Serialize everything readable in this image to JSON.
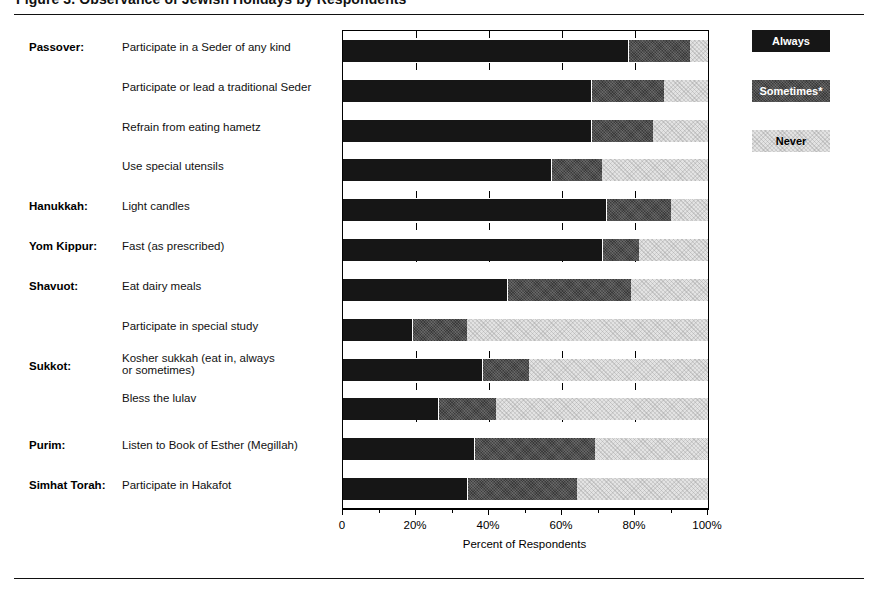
{
  "figure": {
    "title": "Figure 3.  Observance of Jewish Holidays by Respondents",
    "axis_title": "Percent of Respondents"
  },
  "legend": {
    "position": "right",
    "items": [
      {
        "label": "Always",
        "color": "#161616",
        "text_color": "#ffffff"
      },
      {
        "label": "Sometimes*",
        "color": "#3a3a3a",
        "text_color": "#ffffff"
      },
      {
        "label": "Never",
        "color": "#e3e3e3",
        "text_color": "#000000"
      }
    ]
  },
  "chart_data": {
    "type": "bar",
    "orientation": "horizontal",
    "stacked": true,
    "title": "Figure 3.  Observance of Jewish Holidays by Respondents",
    "xlabel": "Percent of Respondents",
    "ylabel": "",
    "xlim": [
      0,
      100
    ],
    "xticks": [
      0,
      20,
      40,
      60,
      80,
      100
    ],
    "xticklabels": [
      "0",
      "20%",
      "40%",
      "60%",
      "80%",
      "100%"
    ],
    "grid": true,
    "grid_style": "dashed vertical",
    "series": [
      {
        "name": "Always",
        "color": "#161616"
      },
      {
        "name": "Sometimes*",
        "color": "#3a3a3a"
      },
      {
        "name": "Never",
        "color": "#e3e3e3"
      }
    ],
    "categories": [
      "Participate in a Seder of any kind",
      "Participate or lead a traditional Seder",
      "Refrain from eating hametz",
      "Use special utensils",
      "Light candles",
      "Fast (as prescribed)",
      "Eat dairy meals",
      "Participate in special study",
      "Kosher sukkah (eat in, always or sometimes)",
      "Bless the lulav",
      "Listen to Book of Esther (Megillah)",
      "Participate in Hakafot"
    ],
    "rows": [
      {
        "holiday": "Passover:",
        "practice": "Participate in a Seder of any kind",
        "always": 78,
        "sometimes": 17,
        "never": 5
      },
      {
        "holiday": "",
        "practice": "Participate or lead a traditional Seder",
        "always": 68,
        "sometimes": 20,
        "never": 12
      },
      {
        "holiday": "",
        "practice": "Refrain from eating hametz",
        "always": 68,
        "sometimes": 17,
        "never": 15
      },
      {
        "holiday": "",
        "practice": "Use special utensils",
        "always": 57,
        "sometimes": 14,
        "never": 29
      },
      {
        "holiday": "Hanukkah:",
        "practice": "Light candles",
        "always": 72,
        "sometimes": 18,
        "never": 10
      },
      {
        "holiday": "Yom Kippur:",
        "practice": "Fast (as prescribed)",
        "always": 71,
        "sometimes": 10,
        "never": 19
      },
      {
        "holiday": "Shavuot:",
        "practice": "Eat dairy meals",
        "always": 45,
        "sometimes": 34,
        "never": 21
      },
      {
        "holiday": "",
        "practice": "Participate in special study",
        "always": 19,
        "sometimes": 15,
        "never": 66
      },
      {
        "holiday": "Sukkot:",
        "practice": "Kosher sukkah (eat in, always or sometimes)",
        "always": 38,
        "sometimes": 13,
        "never": 49
      },
      {
        "holiday": "",
        "practice": "Bless the lulav",
        "always": 26,
        "sometimes": 16,
        "never": 58
      },
      {
        "holiday": "Purim:",
        "practice": "Listen to Book of Esther (Megillah)",
        "always": 36,
        "sometimes": 33,
        "never": 31
      },
      {
        "holiday": "Simhat Torah:",
        "practice": "Participate in Hakafot",
        "always": 34,
        "sometimes": 30,
        "never": 36
      }
    ]
  }
}
